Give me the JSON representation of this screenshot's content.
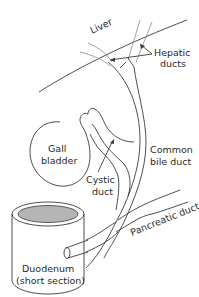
{
  "diagram": {
    "labels": {
      "liver": "Liver",
      "hepatic_ducts_1": "Hepatic",
      "hepatic_ducts_2": "ducts",
      "gall_bladder_1": "Gall",
      "gall_bladder_2": "bladder",
      "cystic_duct_1": "Cystic",
      "cystic_duct_2": "duct",
      "common_bile_duct_1": "Common",
      "common_bile_duct_2": "bile duct",
      "pancreatic_duct": "Pancreatic duct",
      "duodenum_1": "Duodenum",
      "duodenum_2": "(short section)"
    },
    "colors": {
      "line": "#3a3a3a",
      "light_line": "#8a8a8a",
      "duodenum_lumen": "#b5b5b5",
      "text": "#2a2a2a",
      "background": "#ffffff"
    }
  }
}
